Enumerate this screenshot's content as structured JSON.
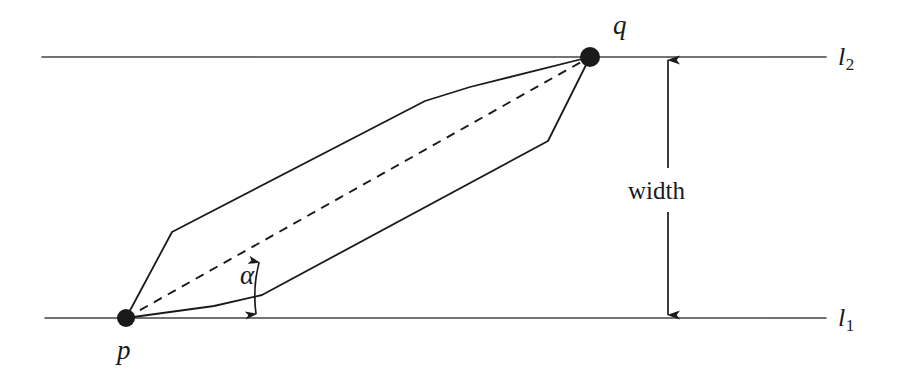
{
  "figure": {
    "background_color": "#ffffff",
    "stroke_color": "#1a1a1a",
    "width_px": 908,
    "height_px": 377
  },
  "labels": {
    "point_p": "p",
    "point_q": "q",
    "line_lower": "l",
    "line_lower_sub": "1",
    "line_upper": "l",
    "line_upper_sub": "2",
    "width": "width",
    "angle": "α"
  },
  "chart_data": {
    "type": "diagram",
    "coordinate_space": {
      "width": 908,
      "height": 377,
      "origin": "top-left"
    },
    "points": [
      {
        "name": "p",
        "label": "p",
        "x": 126,
        "y": 318,
        "marker": "filled-circle",
        "radius": 9
      },
      {
        "name": "q",
        "label": "q",
        "x": 590,
        "y": 57,
        "marker": "filled-circle",
        "radius": 10
      }
    ],
    "lines": [
      {
        "name": "l1",
        "label": "l₁",
        "style": "solid",
        "x1": 45,
        "y1": 318,
        "x2": 826,
        "y2": 318,
        "label_x": 838,
        "label_y": 318
      },
      {
        "name": "l2",
        "label": "l₂",
        "style": "solid",
        "x1": 42,
        "y1": 57,
        "x2": 826,
        "y2": 57,
        "label_x": 838,
        "label_y": 57
      }
    ],
    "polygon": {
      "name": "convex-polygon",
      "style": "solid",
      "closed": true,
      "vertices": [
        {
          "x": 126,
          "y": 318
        },
        {
          "x": 172,
          "y": 232
        },
        {
          "x": 425,
          "y": 101
        },
        {
          "x": 470,
          "y": 87
        },
        {
          "x": 590,
          "y": 57
        },
        {
          "x": 548,
          "y": 141
        },
        {
          "x": 262,
          "y": 295
        },
        {
          "x": 214,
          "y": 306
        }
      ]
    },
    "diagonal": {
      "name": "pq-dashed-segment",
      "style": "dashed",
      "dash_pattern": "9 7",
      "x1": 126,
      "y1": 318,
      "x2": 590,
      "y2": 57
    },
    "width_measure": {
      "name": "width-dimension",
      "label": "width",
      "x": 668,
      "top_y": 57,
      "bottom_y": 318,
      "arrowheads": "both",
      "label_x": 668,
      "label_y": 190,
      "gap_top_y": 168,
      "gap_bottom_y": 212
    },
    "angle_measure": {
      "name": "alpha-angle-arc",
      "label": "α",
      "vertex": {
        "x": 126,
        "y": 318
      },
      "between": [
        "pq-dashed-segment",
        "polygon-lower-edge-at-p"
      ],
      "arc_radius": 135,
      "arrowheads": "both",
      "label_x": 248,
      "label_y": 276
    }
  }
}
